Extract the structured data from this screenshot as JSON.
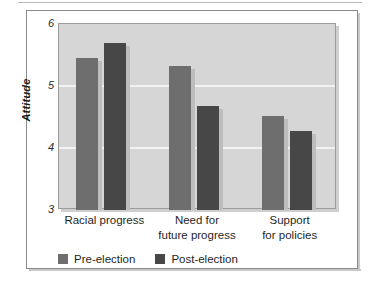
{
  "chart_data": {
    "type": "bar",
    "title": "",
    "subtitle": "",
    "xlabel": "",
    "ylabel": "Attitude",
    "ylim": [
      3,
      6
    ],
    "yticks": [
      6,
      5,
      4,
      3
    ],
    "ytick_labels": [
      "6",
      "5",
      "4",
      "3"
    ],
    "grid": true,
    "grid_axis": "y",
    "legend_position": "bottom-left",
    "categories": [
      "Racial progress",
      "Need for future progress",
      "Support for policies"
    ],
    "category_lines": [
      [
        "Racial progress"
      ],
      [
        "Need for",
        "future progress"
      ],
      [
        "Support",
        "for policies"
      ]
    ],
    "series": [
      {
        "name": "Pre-election",
        "color": "#6e6e6e",
        "values": [
          5.45,
          5.32,
          4.52
        ]
      },
      {
        "name": "Post-election",
        "color": "#474747",
        "values": [
          5.7,
          4.68,
          4.27
        ]
      }
    ],
    "plot_background": "#d6d6d6",
    "gridline_color": "#f2f2f2"
  },
  "legend": {
    "items": [
      {
        "label": "Pre-election",
        "swatch": "pre"
      },
      {
        "label": "Post-election",
        "swatch": "post"
      }
    ]
  }
}
